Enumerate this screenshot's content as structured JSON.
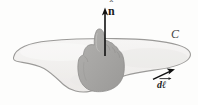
{
  "figure": {
    "type": "physics-diagram",
    "width": 198,
    "height": 105,
    "background_color": "#fdfdfc"
  },
  "labels": {
    "normal_vector": {
      "text": "n",
      "accent": "ˆ",
      "meaning": "unit normal vector n-hat",
      "x": 108,
      "y": 4
    },
    "boundary_curve": {
      "text": "C",
      "meaning": "closed boundary curve C",
      "x": 171,
      "y": 28
    },
    "line_element": {
      "text": "dℓ",
      "meaning": "vector line element d-ell",
      "x": 157,
      "y": 80
    }
  },
  "shapes": {
    "surface": {
      "name": "open-surface",
      "fill_color": "#f1f0ee",
      "stroke_color": "#8d8d8d",
      "description": "irregular amoeba-shaped open surface"
    },
    "hand": {
      "name": "right-hand",
      "fill_color": "#a9a8a6",
      "stroke_color": "#8f8e8c",
      "description": "right hand with thumb pointing up along the normal"
    },
    "normal_arrow": {
      "name": "normal-arrow",
      "color": "#111111",
      "from_x": 105,
      "from_y": 56,
      "to_x": 105,
      "to_y": 9
    },
    "dl_arrow": {
      "name": "line-element-arrow",
      "color": "#111111",
      "from_x": 154,
      "from_y": 79,
      "to_x": 174,
      "to_y": 70
    }
  },
  "colors": {
    "ink": "#111111",
    "surface_fill": "#f1f0ee",
    "surface_stroke": "#8d8d8d",
    "hand_fill": "#a9a8a6",
    "label_gray": "#454545"
  }
}
